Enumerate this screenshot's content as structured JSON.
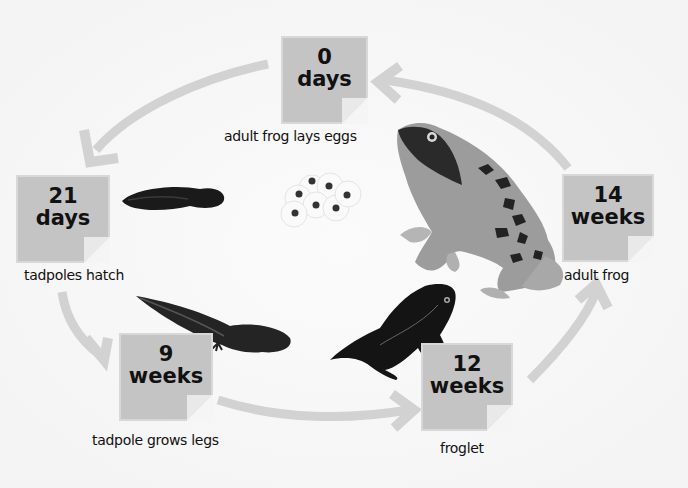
{
  "diagram": {
    "type": "life-cycle",
    "subject": "frog",
    "colors": {
      "background": "#f6f6f6",
      "card": "#c4c4c4",
      "card_border": "#d8d8d8",
      "arrow": "#d2d2d2",
      "text": "#111111"
    },
    "stages": [
      {
        "time_value": "0",
        "time_unit": "days",
        "caption": "adult frog lays eggs",
        "illustration": "frog-eggs-icon"
      },
      {
        "time_value": "21",
        "time_unit": "days",
        "caption": "tadpoles hatch",
        "illustration": "tadpole-icon"
      },
      {
        "time_value": "9",
        "time_unit": "weeks",
        "caption": "tadpole grows legs",
        "illustration": "tadpole-with-legs-icon"
      },
      {
        "time_value": "12",
        "time_unit": "weeks",
        "caption": "froglet",
        "illustration": "froglet-icon"
      },
      {
        "time_value": "14",
        "time_unit": "weeks",
        "caption": "adult frog",
        "illustration": "adult-frog-icon"
      }
    ],
    "arrows": [
      {
        "from": "0 days",
        "to": "21 days"
      },
      {
        "from": "21 days",
        "to": "9 weeks"
      },
      {
        "from": "9 weeks",
        "to": "12 weeks"
      },
      {
        "from": "12 weeks",
        "to": "14 weeks"
      },
      {
        "from": "14 weeks",
        "to": "0 days"
      }
    ]
  }
}
